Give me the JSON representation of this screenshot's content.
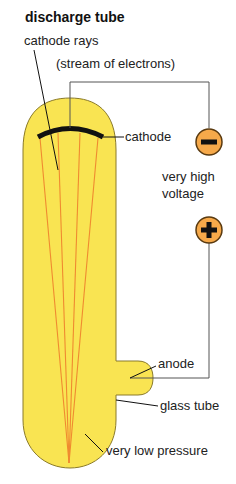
{
  "title": "discharge tube",
  "labels": {
    "cathode_rays": "cathode rays",
    "stream": "(stream of electrons)",
    "cathode": "cathode",
    "voltage_line1": "very high",
    "voltage_line2": "voltage",
    "anode": "anode",
    "glass_tube": "glass tube",
    "low_pressure": "very low pressure"
  },
  "terminals": {
    "negative": "−",
    "positive": "+"
  },
  "colors": {
    "tube_fill": "#f9e452",
    "tube_outline": "#8a7a2a",
    "rays": "#f08a30",
    "terminal_fill": "#f6a94a",
    "cathode": "#111111",
    "wire": "#555555"
  }
}
